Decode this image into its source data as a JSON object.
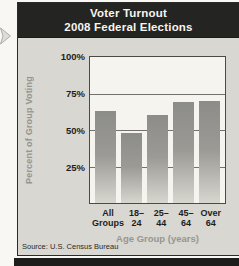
{
  "header": {
    "title_line1": "Voter Turnout",
    "title_line2": "2008 Federal Elections",
    "bg": "#242423",
    "text_color": "#f6f5f1"
  },
  "icons": {
    "margin_arrow": "right-arrow"
  },
  "chart_data": {
    "type": "bar",
    "title": "Voter Turnout 2008 Federal Elections",
    "categories": [
      "All Groups",
      "18–24",
      "25–44",
      "45–64",
      "Over 64"
    ],
    "tick_display": [
      "All\nGroups",
      "18–24",
      "25–44",
      "45–64",
      "Over\n64"
    ],
    "values": [
      63,
      48,
      60,
      69,
      70
    ],
    "xlabel": "Age Group (years)",
    "ylabel": "Percent of Group Voting",
    "ylim": [
      0,
      100
    ],
    "yticks": [
      {
        "label": "100%",
        "value": 100
      },
      {
        "label": "75%",
        "value": 75
      },
      {
        "label": "50%",
        "value": 50
      },
      {
        "label": "25%",
        "value": 25
      }
    ],
    "gridlines": [
      75,
      50,
      25
    ],
    "grid": true,
    "legend": false,
    "bar_color_top": "#8c8c89",
    "bar_color_mid": "#9b9a95",
    "bar_color_bottom": "#d7d6cf",
    "plot_bg": "#f5f4ee",
    "body_bg": "#d8d7d2"
  },
  "source": {
    "text": "Source: U.S. Census Bureau"
  }
}
